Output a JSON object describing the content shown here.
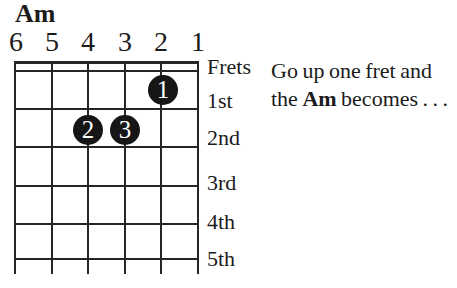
{
  "page": {
    "background": "#ffffff",
    "ink": "#1b1b1b",
    "line_color": "#262626",
    "dot_color": "#161616"
  },
  "diagram": {
    "title": "Am",
    "string_numbers": [
      "6",
      "5",
      "4",
      "3",
      "2",
      "1"
    ],
    "fret_labels": [
      "Frets",
      "1st",
      "2nd",
      "3rd",
      "4th",
      "5th"
    ],
    "fingers": [
      {
        "label": "1",
        "string": "2",
        "fret": "1"
      },
      {
        "label": "2",
        "string": "4",
        "fret": "2"
      },
      {
        "label": "3",
        "string": "3",
        "fret": "2"
      }
    ]
  },
  "caption": {
    "line1": "Go up one fret and",
    "line2_pre": "the ",
    "line2_bold": "Am",
    "line2_post": " becomes . . ."
  }
}
